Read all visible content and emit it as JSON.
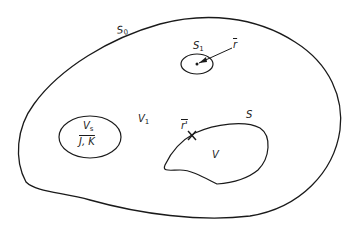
{
  "diagram": {
    "type": "region-diagram",
    "stroke_color": "#1a1a1a",
    "background": "#ffffff",
    "labels": {
      "outer_surface": {
        "base": "S",
        "sub": "0"
      },
      "source_surface": {
        "base": "S",
        "sub": "1"
      },
      "field_point": "r",
      "source_volume": {
        "base": "V",
        "sub": "s"
      },
      "source_quantities": "J, K",
      "intermediate_volume": {
        "base": "V",
        "sub": "1"
      },
      "inner_surface": "S",
      "surface_point": "r'",
      "inner_volume": "V"
    },
    "regions": [
      {
        "name": "outer-boundary",
        "label": "S0",
        "kind": "closed-curve"
      },
      {
        "name": "small-sphere",
        "label": "S1",
        "kind": "ellipse",
        "contains": "field point r"
      },
      {
        "name": "source-region",
        "label": "Vs",
        "kind": "ellipse",
        "contains": "J, K"
      },
      {
        "name": "inner-body",
        "label": "V",
        "boundary": "S",
        "marked_point": "r'"
      }
    ]
  }
}
